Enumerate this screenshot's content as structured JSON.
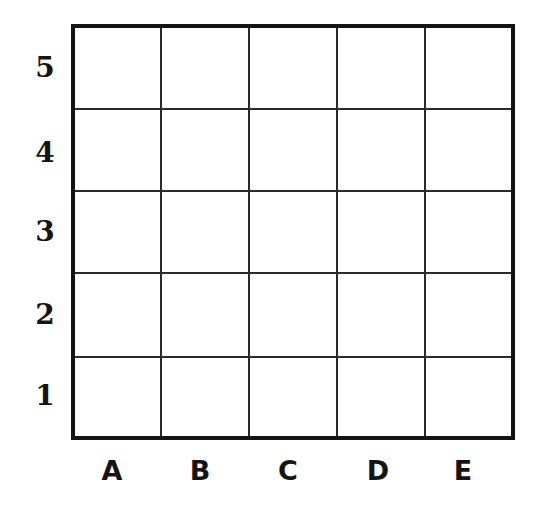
{
  "diagram": {
    "type": "coordinate-grid",
    "columns": [
      "A",
      "B",
      "C",
      "D",
      "E"
    ],
    "rows_top_to_bottom": [
      "5",
      "4",
      "3",
      "2",
      "1"
    ],
    "cells_filled": []
  },
  "labels": {
    "rows": {
      "r5": "5",
      "r4": "4",
      "r3": "3",
      "r2": "2",
      "r1": "1"
    },
    "cols": {
      "a": "A",
      "b": "B",
      "c": "C",
      "d": "D",
      "e": "E"
    }
  },
  "colors": {
    "line": "#141414",
    "background": "#ffffff"
  }
}
